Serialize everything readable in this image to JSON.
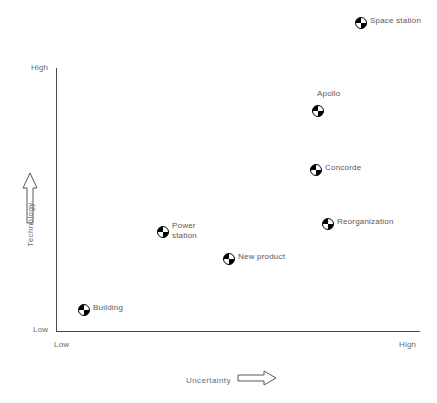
{
  "chart_data": {
    "type": "scatter",
    "title": "",
    "xlabel": "Uncertainty",
    "ylabel": "Technology",
    "x_tick_labels": [
      "Low",
      "High"
    ],
    "y_tick_labels": [
      "Low",
      "High"
    ],
    "xlim": [
      "Low",
      "High"
    ],
    "ylim": [
      "Low",
      "High"
    ],
    "grid": false,
    "legend": "none",
    "x_axis_arrow": "right-arrow-icon",
    "y_axis_arrow": "up-arrow-icon",
    "marker_style": "quadrant-pie-icon",
    "points": [
      {
        "label": "Space station",
        "x": 0.84,
        "y": 1.18,
        "px": 361,
        "py": 21,
        "label_position": "right"
      },
      {
        "label": "Apollo",
        "x": 0.72,
        "y": 0.85,
        "px": 318,
        "py": 109,
        "label_position": "above"
      },
      {
        "label": "Concorde",
        "x": 0.71,
        "y": 0.62,
        "px": 316,
        "py": 168,
        "label_position": "right"
      },
      {
        "label": "Reorganization",
        "x": 0.75,
        "y": 0.42,
        "px": 328,
        "py": 222,
        "label_position": "right"
      },
      {
        "label": "Power\nstation",
        "x": 0.29,
        "y": 0.39,
        "px": 163,
        "py": 230,
        "label_position": "right-2line"
      },
      {
        "label": "New product",
        "x": 0.47,
        "y": 0.28,
        "px": 229,
        "py": 257,
        "label_position": "right"
      },
      {
        "label": "Building",
        "x": 0.08,
        "y": 0.09,
        "px": 84,
        "py": 308,
        "label_position": "right"
      }
    ]
  },
  "axes": {
    "y_high": "High",
    "y_low": "Low",
    "x_low": "Low",
    "x_high": "High",
    "y_title": "Technology",
    "x_title": "Uncertainty"
  },
  "colors": {
    "axis": "#4a4a4c",
    "text": "#58585a",
    "tick_text": "#6a6a6c",
    "marker_fill": "#000000",
    "background": "#ffffff"
  }
}
